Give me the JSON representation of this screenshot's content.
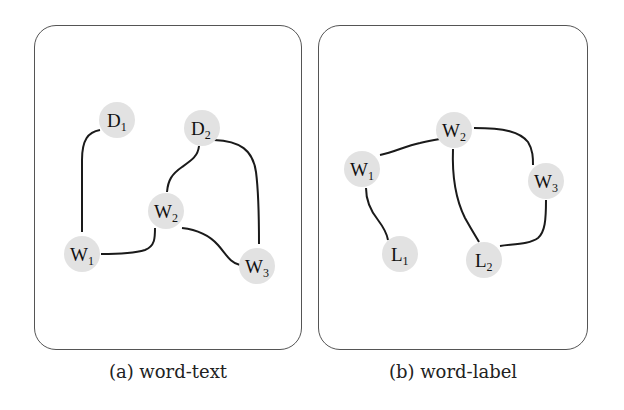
{
  "figure": {
    "panels": [
      {
        "id": "a",
        "caption": "(a) word-text",
        "nodes": [
          {
            "id": "D1",
            "base": "D",
            "sub": "1",
            "x": 117,
            "y": 120
          },
          {
            "id": "D2",
            "base": "D",
            "sub": "2",
            "x": 202,
            "y": 128
          },
          {
            "id": "W2",
            "base": "W",
            "sub": "2",
            "x": 166,
            "y": 211
          },
          {
            "id": "W1",
            "base": "W",
            "sub": "1",
            "x": 82,
            "y": 254
          },
          {
            "id": "W3",
            "base": "W",
            "sub": "3",
            "x": 257,
            "y": 266
          }
        ],
        "edges": [
          [
            "D1",
            "W1"
          ],
          [
            "W1",
            "W2"
          ],
          [
            "W2",
            "D2"
          ],
          [
            "D2",
            "W3"
          ],
          [
            "W2",
            "W3"
          ]
        ]
      },
      {
        "id": "b",
        "caption": "(b) word-label",
        "nodes": [
          {
            "id": "W2",
            "base": "W",
            "sub": "2",
            "x": 454,
            "y": 130
          },
          {
            "id": "W1",
            "base": "W",
            "sub": "1",
            "x": 362,
            "y": 169
          },
          {
            "id": "W3",
            "base": "W",
            "sub": "3",
            "x": 546,
            "y": 181
          },
          {
            "id": "L1",
            "base": "L",
            "sub": "1",
            "x": 400,
            "y": 254
          },
          {
            "id": "L2",
            "base": "L",
            "sub": "2",
            "x": 484,
            "y": 260
          }
        ],
        "edges": [
          [
            "W1",
            "W2"
          ],
          [
            "W2",
            "W3"
          ],
          [
            "W1",
            "L1"
          ],
          [
            "W2",
            "L2"
          ],
          [
            "W3",
            "L2"
          ]
        ]
      }
    ]
  },
  "labels": {
    "caption_a": "(a) word-text",
    "caption_b": "(b) word-label",
    "a": {
      "D1": "D",
      "D1s": "1",
      "D2": "D",
      "D2s": "2",
      "W1": "W",
      "W1s": "1",
      "W2": "W",
      "W2s": "2",
      "W3": "W",
      "W3s": "3"
    },
    "b": {
      "W1": "W",
      "W1s": "1",
      "W2": "W",
      "W2s": "2",
      "W3": "W",
      "W3s": "3",
      "L1": "L",
      "L1s": "1",
      "L2": "L",
      "L2s": "2"
    }
  }
}
